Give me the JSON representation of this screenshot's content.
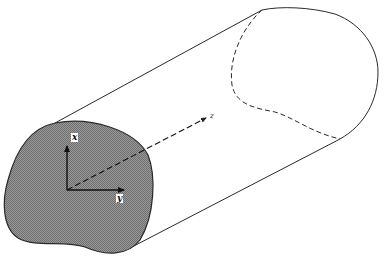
{
  "figure": {
    "axes": {
      "x_label": "x",
      "y_label": "y",
      "z_label": "z"
    },
    "colors": {
      "line": "#2a2a2a",
      "cross_section_fill": "#8c8c8c",
      "background": "#ffffff"
    }
  }
}
